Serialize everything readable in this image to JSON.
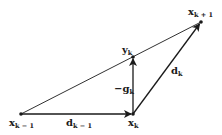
{
  "diagram": {
    "colors": {
      "stroke": "#1a1a1a",
      "background": "#ffffff"
    },
    "points": [
      {
        "id": "x_km1",
        "base": "x",
        "sub": "k − 1",
        "x": 21,
        "y": 114
      },
      {
        "id": "x_k",
        "base": "x",
        "sub": "k",
        "x": 133,
        "y": 114
      },
      {
        "id": "y_k",
        "base": "y",
        "sub": "k",
        "x": 133,
        "y": 57
      },
      {
        "id": "x_kp1",
        "base": "x",
        "sub": "k + 1",
        "x": 201,
        "y": 22
      }
    ],
    "edges": [
      {
        "from": "x_km1",
        "to": "x_k",
        "arrow": true,
        "label_base": "d",
        "label_sub": "k − 1"
      },
      {
        "from": "x_k",
        "to": "y_k",
        "arrow": true,
        "label_base": "−g",
        "label_sub": "k"
      },
      {
        "from": "x_k",
        "to": "x_kp1",
        "arrow": true,
        "label_base": "d",
        "label_sub": "k"
      },
      {
        "from": "x_km1",
        "to": "x_kp1",
        "arrow": false
      }
    ],
    "labels": {
      "x_km1": {
        "base": "x",
        "sub": "k − 1"
      },
      "x_k": {
        "base": "x",
        "sub": "k"
      },
      "y_k": {
        "base": "y",
        "sub": "k"
      },
      "x_kp1": {
        "base": "x",
        "sub": "k + 1"
      },
      "d_km1": {
        "base": "d",
        "sub": "k − 1"
      },
      "neg_g_k": {
        "base": "−g",
        "sub": "k"
      },
      "d_k": {
        "base": "d",
        "sub": "k"
      }
    }
  }
}
